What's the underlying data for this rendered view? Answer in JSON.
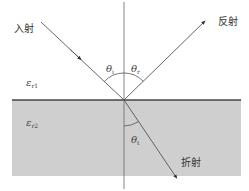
{
  "diagram": {
    "type": "reflection-refraction-at-interface",
    "colors": {
      "background": "#ffffff",
      "medium2_fill": "#cfcfcf",
      "line": "#555555",
      "interface": "#444444"
    },
    "labels": {
      "incident": "入射",
      "reflected": "反射",
      "refracted": "折射"
    },
    "media": {
      "medium1": {
        "symbol": "ε",
        "sub": "r1"
      },
      "medium2": {
        "symbol": "ε",
        "sub": "r2"
      }
    },
    "angles": {
      "incident": {
        "symbol": "θ",
        "sub": "i"
      },
      "reflected": {
        "symbol": "θ",
        "sub": "r"
      },
      "transmitted": {
        "symbol": "θ",
        "sub": "t"
      }
    }
  }
}
